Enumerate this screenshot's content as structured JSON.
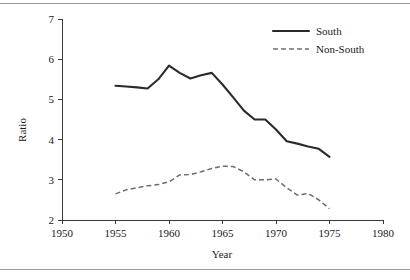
{
  "chart_data": {
    "type": "line",
    "title": "",
    "xlabel": "Year",
    "ylabel": "Ratio",
    "xlim": [
      1950,
      1980
    ],
    "ylim": [
      2,
      7
    ],
    "xticks": [
      1950,
      1955,
      1960,
      1965,
      1970,
      1975,
      1980
    ],
    "yticks": [
      2,
      3,
      4,
      5,
      6,
      7
    ],
    "grid": false,
    "legend_position": "top-right",
    "series": [
      {
        "name": "South",
        "style": "solid",
        "color": "#2b2b2b",
        "x": [
          1955,
          1956,
          1957,
          1958,
          1959,
          1960,
          1961,
          1962,
          1963,
          1964,
          1965,
          1966,
          1967,
          1968,
          1969,
          1970,
          1971,
          1972,
          1973,
          1974,
          1975
        ],
        "values": [
          5.34,
          5.32,
          5.3,
          5.27,
          5.5,
          5.84,
          5.66,
          5.52,
          5.6,
          5.66,
          5.37,
          5.05,
          4.72,
          4.5,
          4.5,
          4.25,
          3.96,
          3.9,
          3.83,
          3.77,
          3.57
        ]
      },
      {
        "name": "Non-South",
        "style": "dashed",
        "color": "#6d6d6d",
        "x": [
          1955,
          1956,
          1957,
          1958,
          1959,
          1960,
          1961,
          1962,
          1963,
          1964,
          1965,
          1966,
          1967,
          1968,
          1969,
          1970,
          1971,
          1972,
          1973,
          1974,
          1975
        ],
        "values": [
          2.65,
          2.75,
          2.8,
          2.85,
          2.88,
          2.95,
          3.12,
          3.13,
          3.2,
          3.28,
          3.34,
          3.33,
          3.2,
          3.0,
          3.0,
          3.02,
          2.8,
          2.62,
          2.66,
          2.5,
          2.28
        ]
      }
    ]
  },
  "legend": {
    "entries": [
      {
        "label": "South"
      },
      {
        "label": "Non-South"
      }
    ]
  },
  "axes": {
    "y_title": "Ratio",
    "x_title": "Year",
    "x_tick_labels": [
      "1950",
      "1955",
      "1960",
      "1965",
      "1970",
      "1975",
      "1980"
    ],
    "y_tick_labels": [
      "2",
      "3",
      "4",
      "5",
      "6",
      "7"
    ]
  }
}
